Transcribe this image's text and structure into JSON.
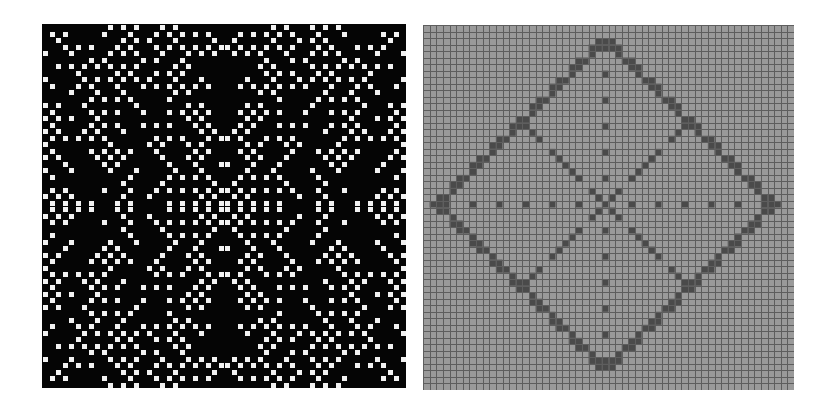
{
  "figures": [
    {
      "id": "left",
      "description": "Binary cellular automaton pattern, white cells on black, 4-fold symmetric",
      "grid_size": 56,
      "background": "#050505",
      "cell_color": "#f2f2f2"
    },
    {
      "id": "right",
      "description": "Gray grid with dark cells forming a nested diamond pattern",
      "grid_size": 56,
      "background": "#9a9a9a",
      "grid_line_color": "#5e5e5e",
      "cell_color": "#4a4a4a",
      "diamond_center": [
        27,
        27
      ],
      "diamond_radius": 25
    }
  ]
}
